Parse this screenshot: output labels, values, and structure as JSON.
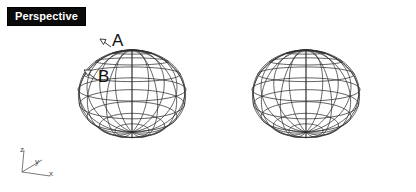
{
  "canvas": {
    "width": 416,
    "height": 192,
    "background": "#ffffff"
  },
  "viewport": {
    "label": "Perspective",
    "label_background": "#0b0b0b",
    "label_color": "#ffffff"
  },
  "callouts": [
    {
      "id": "A",
      "text": "A"
    },
    {
      "id": "B",
      "text": "B"
    }
  ],
  "axis_gizmo": {
    "origin": {
      "x": 22,
      "y": 172
    },
    "axes": [
      {
        "name": "z",
        "label": "z",
        "end": {
          "x": 24,
          "y": 150
        }
      },
      {
        "name": "y",
        "label": "y",
        "end": {
          "x": 42,
          "y": 160
        }
      },
      {
        "name": "x",
        "label": "x",
        "end": {
          "x": 50,
          "y": 176
        }
      }
    ],
    "color": "#6b6b6b"
  },
  "spheres": [
    {
      "name": "left-sphere",
      "cx": 132,
      "cy": 94,
      "rx": 66,
      "ry": 84,
      "latitudes": 9,
      "longitudes": 16,
      "stroke": "#2e2e2e",
      "stroke_width": 0.75
    },
    {
      "name": "right-sphere",
      "cx": 306,
      "cy": 94,
      "rx": 66,
      "ry": 84,
      "latitudes": 9,
      "longitudes": 16,
      "stroke": "#2e2e2e",
      "stroke_width": 0.75
    }
  ],
  "footer": {
    "copyright": "© 2014 Cengage Learning®. All Rights Reserved.",
    "color": "#8e8e8e"
  }
}
